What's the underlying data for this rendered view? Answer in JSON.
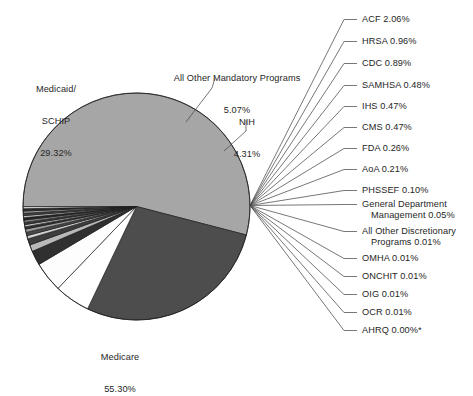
{
  "figure": {
    "title": "",
    "background_color": "#ffffff",
    "text_color": "#262626",
    "stroke_color": "#3a3a3a"
  },
  "chart_data": {
    "type": "pie",
    "title": "",
    "xlabel": "",
    "ylabel": "",
    "units": "percent",
    "total": 100.0,
    "start_angle_deg": 180,
    "direction": "clockwise",
    "legend": "none (direct labels with leader lines)",
    "grid": false,
    "categories": [
      "Medicare",
      "Medicaid/SCHIP",
      "All Other Mandatory Programs",
      "NIH",
      "ACF",
      "HRSA",
      "CDC",
      "SAMHSA",
      "IHS",
      "CMS",
      "FDA",
      "AoA",
      "PHSSEF",
      "General Department Management",
      "All Other Discretionary Programs",
      "OMHA",
      "ONCHIT",
      "OIG",
      "OCR",
      "AHRQ"
    ],
    "values": [
      55.3,
      29.32,
      5.07,
      4.31,
      2.06,
      0.96,
      0.89,
      0.48,
      0.47,
      0.47,
      0.26,
      0.21,
      0.1,
      0.05,
      0.01,
      0.01,
      0.01,
      0.01,
      0.01,
      0.0
    ],
    "value_labels": [
      "55.30%",
      "29.32%",
      "5.07%",
      "4.31%",
      "2.06%",
      "0.96%",
      "0.89%",
      "0.48%",
      "0.47%",
      "0.47%",
      "0.26%",
      "0.21%",
      "0.10%",
      "0.05%",
      "0.01%",
      "0.01%",
      "0.01%",
      "0.01%",
      "0.01%",
      "0.00%*"
    ],
    "slice_colors": [
      "#a6a6a6",
      "#4d4d4d",
      "#ffffff",
      "#fdfdfd",
      "#303030",
      "#b8b8b8",
      "#3d3d3d",
      "#d0d0d0",
      "#4a4a4a",
      "#9a9a9a",
      "#2e2e2e",
      "#c4c4c4",
      "#3a3a3a",
      "#8e8e8e",
      "#252525",
      "#bdbdbd",
      "#444444",
      "#9f9f9f",
      "#2a2a2a",
      "#cccccc"
    ],
    "footnote": "*"
  },
  "labels": {
    "medicaid": {
      "line1": "Medicaid/",
      "line2": "SCHIP",
      "line3": "29.32%"
    },
    "medicare": {
      "line1": "Medicare",
      "line2": "55.30%"
    },
    "all_other_mandatory": {
      "line1": "All Other Mandatory Programs",
      "line2": "5.07%"
    },
    "nih": {
      "line1": "NIH",
      "line2": "4.31%"
    }
  },
  "callouts": [
    {
      "name": "acf",
      "text": "ACF 2.06%"
    },
    {
      "name": "hrsa",
      "text": "HRSA 0.96%"
    },
    {
      "name": "cdc",
      "text": "CDC 0.89%"
    },
    {
      "name": "samhsa",
      "text": "SAMHSA 0.48%"
    },
    {
      "name": "ihs",
      "text": "IHS 0.47%"
    },
    {
      "name": "cms",
      "text": "CMS 0.47%"
    },
    {
      "name": "fda",
      "text": "FDA 0.26%"
    },
    {
      "name": "aoa",
      "text": "AoA 0.21%"
    },
    {
      "name": "phssef",
      "text": "PHSSEF 0.10%"
    },
    {
      "name": "general-department-management",
      "text": "General Department",
      "text2": "Management 0.05%"
    },
    {
      "name": "all-other-discretionary-programs",
      "text": "All Other Discretionary",
      "text2": "Programs 0.01%"
    },
    {
      "name": "omha",
      "text": "OMHA 0.01%"
    },
    {
      "name": "onchit",
      "text": "ONCHIT 0.01%"
    },
    {
      "name": "oig",
      "text": "OIG 0.01%"
    },
    {
      "name": "ocr",
      "text": "OCR 0.01%"
    },
    {
      "name": "ahrq",
      "text": "AHRQ 0.00%*"
    }
  ]
}
